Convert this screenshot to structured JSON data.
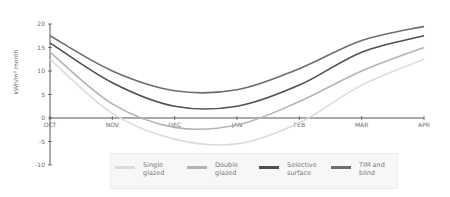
{
  "chart_data": {
    "type": "line",
    "title": "",
    "xlabel": "",
    "ylabel": "kWh/m² month",
    "categories": [
      "OCT",
      "NOV",
      "DEC",
      "JAN",
      "FEB",
      "MAR",
      "APR"
    ],
    "yticks": [
      20,
      15,
      10,
      5,
      0,
      -5,
      -10
    ],
    "ylim": [
      -10,
      20
    ],
    "grid": false,
    "legend_position": "bottom",
    "series": [
      {
        "name": "Single glazed",
        "color": "#dcdcdc",
        "values": [
          12.5,
          1,
          -4.5,
          -5.5,
          -1,
          7,
          12.5
        ]
      },
      {
        "name": "Double glazed",
        "color": "#b4b4b4",
        "values": [
          14,
          3,
          -2,
          -1.5,
          3.5,
          10,
          15
        ]
      },
      {
        "name": "Selective surface",
        "color": "#505050",
        "values": [
          16,
          7.5,
          2.5,
          2.5,
          7,
          14,
          17.5
        ]
      },
      {
        "name": "TIM and blind",
        "color": "#6e6e6e",
        "values": [
          17.5,
          10,
          5.8,
          6,
          10.5,
          16.5,
          19.5
        ]
      }
    ]
  },
  "legend": {
    "items": [
      {
        "label": "Single\nglazed",
        "color": "#dcdcdc"
      },
      {
        "label": "Double\nglazed",
        "color": "#b4b4b4"
      },
      {
        "label": "Selective\nsurface",
        "color": "#505050"
      },
      {
        "label": "TIM and\nblind",
        "color": "#6e6e6e"
      }
    ]
  }
}
